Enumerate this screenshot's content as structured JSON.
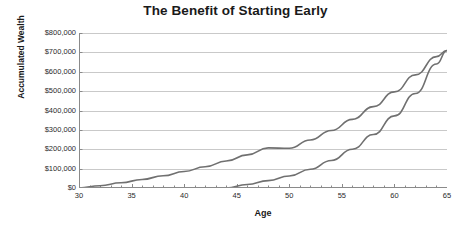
{
  "chart_data": {
    "type": "line",
    "title": "The Benefit of Starting Early",
    "xlabel": "Age",
    "ylabel": "Accumulated Wealth",
    "xlim": [
      30,
      65
    ],
    "ylim": [
      0,
      800000
    ],
    "grid": true,
    "legend": "none",
    "xticks": [
      30,
      35,
      40,
      45,
      50,
      55,
      60,
      65
    ],
    "xtick_labels": [
      "30",
      "35",
      "40",
      "45",
      "50",
      "55",
      "60",
      "65"
    ],
    "yticks": [
      0,
      100000,
      200000,
      300000,
      400000,
      500000,
      600000,
      700000,
      800000
    ],
    "ytick_labels": [
      "$0",
      "$100,000",
      "$200,000",
      "$300,000",
      "$400,000",
      "$500,000",
      "$600,000",
      "$700,000",
      "$800,000"
    ],
    "series": [
      {
        "name": "early-start-investor",
        "color": "#707070",
        "x": [
          30,
          32,
          34,
          36,
          38,
          40,
          42,
          44,
          46,
          48,
          50,
          52,
          54,
          56,
          58,
          60,
          62,
          64,
          65
        ],
        "values": [
          0,
          12000,
          27000,
          44000,
          63000,
          85000,
          110000,
          139000,
          171000,
          207000,
          205000,
          248000,
          297000,
          354000,
          420000,
          496000,
          584000,
          678000,
          710000
        ]
      },
      {
        "name": "late-start-investor",
        "color": "#707070",
        "x": [
          30,
          35,
          40,
          44,
          46,
          48,
          50,
          52,
          54,
          56,
          58,
          60,
          62,
          64,
          65
        ],
        "values": [
          0,
          0,
          0,
          0,
          18000,
          38000,
          62000,
          97000,
          142000,
          200000,
          276000,
          372000,
          488000,
          640000,
          710000
        ]
      }
    ],
    "colors": {
      "line": "#707070",
      "grid": "#c9c9c9",
      "axis": "#8a8a8a",
      "text": "#1a1a1a",
      "background": "#ffffff"
    }
  }
}
